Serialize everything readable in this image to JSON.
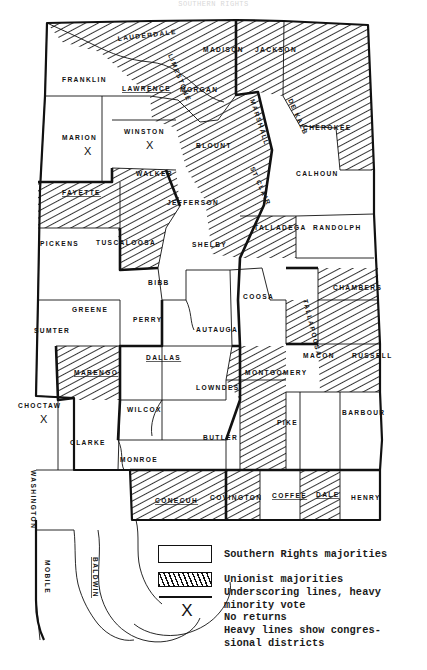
{
  "title": "SOUTHERN RIGHTS",
  "map": {
    "name": "alabama-1851-congressional-election-map",
    "state": "Alabama",
    "fill_plain": "#ffffff",
    "fill_hatch": "#111111",
    "outline_color": "#111111"
  },
  "legend": {
    "items": [
      {
        "swatch": "plain-box",
        "label": "Southern Rights majorities"
      },
      {
        "swatch": "hatched-box",
        "label": "Unionist majorities"
      },
      {
        "swatch": "heavy-rule",
        "label": "Underscoring lines, heavy\nminority vote"
      },
      {
        "swatch": "x-mark",
        "label": "No returns"
      },
      {
        "swatch": "none",
        "label": "Heavy lines show congres-\nsional districts"
      }
    ]
  },
  "counties": [
    {
      "name": "LAUDERDALE",
      "fill": "hatch",
      "x": 118,
      "y": 41,
      "rot": -7,
      "under": false,
      "noreturn": false
    },
    {
      "name": "FRANKLIN",
      "fill": "plain",
      "x": 62,
      "y": 82,
      "rot": 0,
      "under": false,
      "noreturn": false
    },
    {
      "name": "LAWRENCE",
      "fill": "plain",
      "x": 122,
      "y": 91,
      "rot": 0,
      "under": true,
      "noreturn": false
    },
    {
      "name": "LIMESTONE",
      "fill": "hatch",
      "x": 168,
      "y": 55,
      "rot": 68,
      "under": false,
      "noreturn": false
    },
    {
      "name": "MADISON",
      "fill": "hatch",
      "x": 203,
      "y": 52,
      "rot": 0,
      "under": false,
      "noreturn": false
    },
    {
      "name": "JACKSON",
      "fill": "hatch",
      "x": 255,
      "y": 52,
      "rot": 0,
      "under": false,
      "noreturn": false
    },
    {
      "name": "MORGAN",
      "fill": "hatch",
      "x": 180,
      "y": 92,
      "rot": 0,
      "under": false,
      "noreturn": false
    },
    {
      "name": "MARSHALL",
      "fill": "hatch",
      "x": 250,
      "y": 100,
      "rot": 72,
      "under": false,
      "noreturn": false
    },
    {
      "name": "DE KALB",
      "fill": "hatch",
      "x": 288,
      "y": 100,
      "rot": 66,
      "under": false,
      "noreturn": false
    },
    {
      "name": "CHEROKEE",
      "fill": "hatch",
      "x": 303,
      "y": 130,
      "rot": 0,
      "under": false,
      "noreturn": false
    },
    {
      "name": "MARION",
      "fill": "plain",
      "x": 62,
      "y": 140,
      "rot": 0,
      "under": false,
      "noreturn": true
    },
    {
      "name": "WINSTON",
      "fill": "plain",
      "x": 124,
      "y": 134,
      "rot": 0,
      "under": false,
      "noreturn": true
    },
    {
      "name": "BLOUNT",
      "fill": "hatch",
      "x": 196,
      "y": 148,
      "rot": 0,
      "under": false,
      "noreturn": false
    },
    {
      "name": "ST CLAIR",
      "fill": "hatch",
      "x": 250,
      "y": 168,
      "rot": 66,
      "under": false,
      "noreturn": false
    },
    {
      "name": "CALHOUN",
      "fill": "plain",
      "x": 296,
      "y": 176,
      "rot": 0,
      "under": false,
      "noreturn": false
    },
    {
      "name": "WALKER",
      "fill": "hatch",
      "x": 136,
      "y": 176,
      "rot": 0,
      "under": false,
      "noreturn": false
    },
    {
      "name": "FAYETTE",
      "fill": "hatch",
      "x": 62,
      "y": 195,
      "rot": 0,
      "under": true,
      "noreturn": false
    },
    {
      "name": "JEFFERSON",
      "fill": "plain",
      "x": 167,
      "y": 205,
      "rot": 0,
      "under": false,
      "noreturn": false
    },
    {
      "name": "TALLADEGA",
      "fill": "hatch",
      "x": 254,
      "y": 230,
      "rot": 0,
      "under": false,
      "noreturn": false
    },
    {
      "name": "RANDOLPH",
      "fill": "plain",
      "x": 313,
      "y": 230,
      "rot": 0,
      "under": false,
      "noreturn": false
    },
    {
      "name": "PICKENS",
      "fill": "plain",
      "x": 40,
      "y": 246,
      "rot": 0,
      "under": false,
      "noreturn": false
    },
    {
      "name": "TUSCALOOSA",
      "fill": "hatch",
      "x": 96,
      "y": 245,
      "rot": 0,
      "under": false,
      "noreturn": false
    },
    {
      "name": "SHELBY",
      "fill": "plain",
      "x": 192,
      "y": 247,
      "rot": 0,
      "under": false,
      "noreturn": false
    },
    {
      "name": "BIBB",
      "fill": "plain",
      "x": 148,
      "y": 285,
      "rot": 0,
      "under": false,
      "noreturn": false
    },
    {
      "name": "COOSA",
      "fill": "plain",
      "x": 243,
      "y": 299,
      "rot": 0,
      "under": false,
      "noreturn": false
    },
    {
      "name": "TALLAPOOSA",
      "fill": "plain",
      "x": 303,
      "y": 300,
      "rot": 76,
      "under": false,
      "noreturn": false
    },
    {
      "name": "CHAMBERS",
      "fill": "hatch",
      "x": 333,
      "y": 290,
      "rot": 0,
      "under": false,
      "noreturn": false
    },
    {
      "name": "GREENE",
      "fill": "plain",
      "x": 72,
      "y": 312,
      "rot": 0,
      "under": false,
      "noreturn": false
    },
    {
      "name": "PERRY",
      "fill": "plain",
      "x": 133,
      "y": 322,
      "rot": 0,
      "under": false,
      "noreturn": false
    },
    {
      "name": "AUTAUGA",
      "fill": "plain",
      "x": 196,
      "y": 332,
      "rot": 0,
      "under": false,
      "noreturn": false
    },
    {
      "name": "SUMTER",
      "fill": "plain",
      "x": 34,
      "y": 333,
      "rot": 0,
      "under": false,
      "noreturn": false
    },
    {
      "name": "DALLAS",
      "fill": "plain",
      "x": 146,
      "y": 360,
      "rot": 0,
      "under": true,
      "noreturn": false
    },
    {
      "name": "MARENGO",
      "fill": "hatch",
      "x": 74,
      "y": 375,
      "rot": 0,
      "under": true,
      "noreturn": false
    },
    {
      "name": "MONTGOMERY",
      "fill": "hatch",
      "x": 245,
      "y": 375,
      "rot": 0,
      "under": false,
      "noreturn": false
    },
    {
      "name": "MACON",
      "fill": "hatch",
      "x": 303,
      "y": 358,
      "rot": 0,
      "under": false,
      "noreturn": false
    },
    {
      "name": "RUSSELL",
      "fill": "hatch",
      "x": 352,
      "y": 358,
      "rot": 0,
      "under": false,
      "noreturn": false
    },
    {
      "name": "LOWNDES",
      "fill": "plain",
      "x": 196,
      "y": 390,
      "rot": 0,
      "under": false,
      "noreturn": false
    },
    {
      "name": "CHOCTAW",
      "fill": "plain",
      "x": 18,
      "y": 408,
      "rot": 0,
      "under": false,
      "noreturn": true
    },
    {
      "name": "WILCOX",
      "fill": "plain",
      "x": 127,
      "y": 412,
      "rot": 0,
      "under": false,
      "noreturn": false
    },
    {
      "name": "PIKE",
      "fill": "hatch",
      "x": 277,
      "y": 425,
      "rot": 0,
      "under": false,
      "noreturn": false
    },
    {
      "name": "BARBOUR",
      "fill": "plain",
      "x": 342,
      "y": 415,
      "rot": 0,
      "under": false,
      "noreturn": false
    },
    {
      "name": "CLARKE",
      "fill": "plain",
      "x": 70,
      "y": 445,
      "rot": 0,
      "under": false,
      "noreturn": false
    },
    {
      "name": "MONROE",
      "fill": "plain",
      "x": 120,
      "y": 462,
      "rot": 0,
      "under": false,
      "noreturn": false
    },
    {
      "name": "BUTLER",
      "fill": "plain",
      "x": 203,
      "y": 440,
      "rot": 0,
      "under": false,
      "noreturn": false
    },
    {
      "name": "WASHINGTON",
      "fill": "plain",
      "x": 31,
      "y": 470,
      "rot": 90,
      "under": false,
      "noreturn": false
    },
    {
      "name": "CONECUH",
      "fill": "hatch",
      "x": 155,
      "y": 503,
      "rot": 0,
      "under": true,
      "noreturn": false
    },
    {
      "name": "COVINGTON",
      "fill": "hatch",
      "x": 210,
      "y": 500,
      "rot": 0,
      "under": false,
      "noreturn": false
    },
    {
      "name": "COFFEE",
      "fill": "plain",
      "x": 272,
      "y": 498,
      "rot": 0,
      "under": true,
      "noreturn": false
    },
    {
      "name": "DALE",
      "fill": "hatch",
      "x": 316,
      "y": 497,
      "rot": 0,
      "under": true,
      "noreturn": false
    },
    {
      "name": "HENRY",
      "fill": "plain",
      "x": 351,
      "y": 500,
      "rot": 0,
      "under": false,
      "noreturn": false
    },
    {
      "name": "MOBILE",
      "fill": "plain",
      "x": 45,
      "y": 560,
      "rot": 90,
      "under": false,
      "noreturn": false
    },
    {
      "name": "BALDWIN",
      "fill": "plain",
      "x": 93,
      "y": 557,
      "rot": 90,
      "under": true,
      "noreturn": false
    }
  ]
}
